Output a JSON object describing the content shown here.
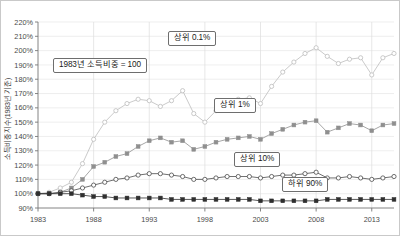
{
  "figure": {
    "background": "#ffffff",
    "border_color": "#c9c9c9"
  },
  "axis": {
    "ylabel": "소득비중지수(1983년 기준)",
    "ytick_labels": [
      "220%",
      "210%",
      "200%",
      "190%",
      "180%",
      "170%",
      "160%",
      "150%",
      "140%",
      "130%",
      "120%",
      "110%",
      "100%",
      "90%"
    ],
    "xtick_labels": [
      "1983",
      "1988",
      "1993",
      "1998",
      "2003",
      "2008",
      "2013"
    ]
  },
  "annotations": {
    "base": "1983년 소득비중 = 100",
    "top01": "상위 0.1%",
    "top1": "상위 1%",
    "top10": "상위 10%",
    "bottom90": "하위 90%"
  },
  "chart_data": {
    "type": "line",
    "title": "",
    "xlabel": "",
    "ylabel": "소득비중지수(1983년 기준)",
    "ylim": [
      90,
      220
    ],
    "ytick_step": 10,
    "ytick_labels": [
      "90%",
      "100%",
      "110%",
      "120%",
      "130%",
      "140%",
      "150%",
      "160%",
      "170%",
      "180%",
      "190%",
      "200%",
      "210%",
      "220%"
    ],
    "xlim": [
      1983,
      2015
    ],
    "xticks": [
      1983,
      1988,
      1993,
      1998,
      2003,
      2008,
      2013
    ],
    "grid": true,
    "legend": "inline-annotations",
    "x": [
      1983,
      1984,
      1985,
      1986,
      1987,
      1988,
      1989,
      1990,
      1991,
      1992,
      1993,
      1994,
      1995,
      1996,
      1997,
      1998,
      1999,
      2000,
      2001,
      2002,
      2003,
      2004,
      2005,
      2006,
      2007,
      2008,
      2009,
      2010,
      2011,
      2012,
      2013,
      2014,
      2015
    ],
    "series": [
      {
        "name": "상위 0.1%",
        "color": "#bdbdbd",
        "marker": "open-circle",
        "values": [
          100,
          101,
          104,
          108,
          121,
          138,
          150,
          158,
          163,
          166,
          165,
          161,
          165,
          172,
          156,
          150,
          158,
          164,
          166,
          167,
          163,
          175,
          185,
          192,
          198,
          202,
          196,
          191,
          194,
          195,
          183,
          195,
          198
        ]
      },
      {
        "name": "상위 1%",
        "color": "#8f8f8f",
        "marker": "filled-square",
        "values": [
          100,
          100,
          101,
          104,
          110,
          119,
          122,
          126,
          128,
          133,
          137,
          139,
          136,
          137,
          131,
          133,
          136,
          138,
          139,
          140,
          138,
          142,
          145,
          148,
          150,
          151,
          143,
          146,
          149,
          148,
          144,
          148,
          149
        ]
      },
      {
        "name": "상위 10%",
        "color": "#4a4a4a",
        "marker": "open-circle",
        "values": [
          100,
          100,
          101,
          102,
          104,
          106,
          108,
          110,
          111,
          113,
          114,
          114,
          113,
          112,
          110,
          110,
          111,
          112,
          112,
          112,
          111,
          112,
          113,
          113,
          114,
          115,
          111,
          111,
          112,
          111,
          110,
          111,
          112
        ]
      },
      {
        "name": "하위 90%",
        "color": "#2f2f2f",
        "marker": "filled-square",
        "values": [
          100,
          100,
          100,
          100,
          99,
          98,
          98,
          97,
          97,
          97,
          97,
          97,
          96,
          96,
          96,
          96,
          96,
          96,
          96,
          96,
          95,
          95,
          95,
          95,
          95,
          95,
          96,
          96,
          96,
          96,
          96,
          96,
          96
        ]
      }
    ]
  }
}
